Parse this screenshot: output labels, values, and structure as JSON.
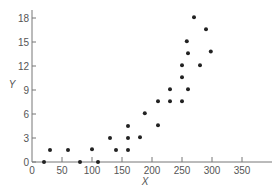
{
  "chart_data": {
    "type": "scatter",
    "title": "",
    "xlabel": "X",
    "ylabel": "Y",
    "xlim": [
      0,
      400
    ],
    "ylim": [
      0,
      19
    ],
    "x_ticks": [
      0,
      50,
      100,
      150,
      200,
      250,
      300,
      350
    ],
    "y_ticks": [
      0,
      3,
      6,
      9,
      12,
      15,
      18
    ],
    "grid": false,
    "legend": null,
    "points": [
      {
        "x": 20,
        "y": 0
      },
      {
        "x": 30,
        "y": 1.5
      },
      {
        "x": 60,
        "y": 1.5
      },
      {
        "x": 80,
        "y": 0
      },
      {
        "x": 100,
        "y": 1.6
      },
      {
        "x": 110,
        "y": 0
      },
      {
        "x": 130,
        "y": 3
      },
      {
        "x": 140,
        "y": 1.5
      },
      {
        "x": 160,
        "y": 4.5
      },
      {
        "x": 160,
        "y": 3
      },
      {
        "x": 160,
        "y": 1.5
      },
      {
        "x": 180,
        "y": 3.1
      },
      {
        "x": 188,
        "y": 6.1
      },
      {
        "x": 210,
        "y": 4.6
      },
      {
        "x": 210,
        "y": 7.6
      },
      {
        "x": 230,
        "y": 7.6
      },
      {
        "x": 230,
        "y": 9.1
      },
      {
        "x": 250,
        "y": 7.6
      },
      {
        "x": 250,
        "y": 10.6
      },
      {
        "x": 250,
        "y": 12.1
      },
      {
        "x": 260,
        "y": 9.1
      },
      {
        "x": 260,
        "y": 13.6
      },
      {
        "x": 258,
        "y": 15.1
      },
      {
        "x": 270,
        "y": 18.1
      },
      {
        "x": 280,
        "y": 12.1
      },
      {
        "x": 290,
        "y": 16.6
      },
      {
        "x": 298,
        "y": 13.8
      }
    ]
  }
}
